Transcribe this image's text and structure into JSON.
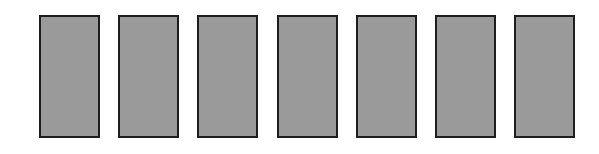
{
  "diagram": {
    "colors": {
      "fill": "#9a9a9a",
      "border": "#1e1e1e",
      "background": "#ffffff"
    },
    "dominoes": [
      {
        "left": 39,
        "top_label": "",
        "bottom_label": ""
      },
      {
        "left": 118,
        "top_label": "",
        "bottom_label": ""
      },
      {
        "left": 197,
        "top_label": "",
        "bottom_label": ""
      },
      {
        "left": 277,
        "top_label": "",
        "bottom_label": ""
      },
      {
        "left": 356,
        "top_label": "",
        "bottom_label": ""
      },
      {
        "left": 435,
        "top_label": "",
        "bottom_label": ""
      },
      {
        "left": 514,
        "top_label": "",
        "bottom_label": ""
      }
    ]
  }
}
